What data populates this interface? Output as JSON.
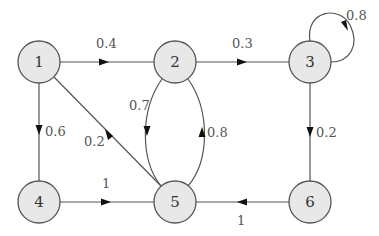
{
  "diagram": {
    "type": "weighted-directed-graph",
    "nodes": [
      {
        "id": "1",
        "label": "1"
      },
      {
        "id": "2",
        "label": "2"
      },
      {
        "id": "3",
        "label": "3"
      },
      {
        "id": "4",
        "label": "4"
      },
      {
        "id": "5",
        "label": "5"
      },
      {
        "id": "6",
        "label": "6"
      }
    ],
    "edges": [
      {
        "from": "1",
        "to": "2",
        "weight": "0.4"
      },
      {
        "from": "2",
        "to": "3",
        "weight": "0.3"
      },
      {
        "from": "3",
        "to": "3",
        "weight": "0.8"
      },
      {
        "from": "1",
        "to": "4",
        "weight": "0.6"
      },
      {
        "from": "5",
        "to": "1",
        "weight": "0.2"
      },
      {
        "from": "2",
        "to": "5",
        "weight": "0.7"
      },
      {
        "from": "5",
        "to": "2",
        "weight": "0.8"
      },
      {
        "from": "3",
        "to": "6",
        "weight": "0.2"
      },
      {
        "from": "4",
        "to": "5",
        "weight": "1"
      },
      {
        "from": "6",
        "to": "5",
        "weight": "1"
      }
    ]
  },
  "colors": {
    "node_fill": "#e8e8e8",
    "node_stroke": "#555555",
    "edge": "#555555",
    "arrow": "#111111"
  }
}
